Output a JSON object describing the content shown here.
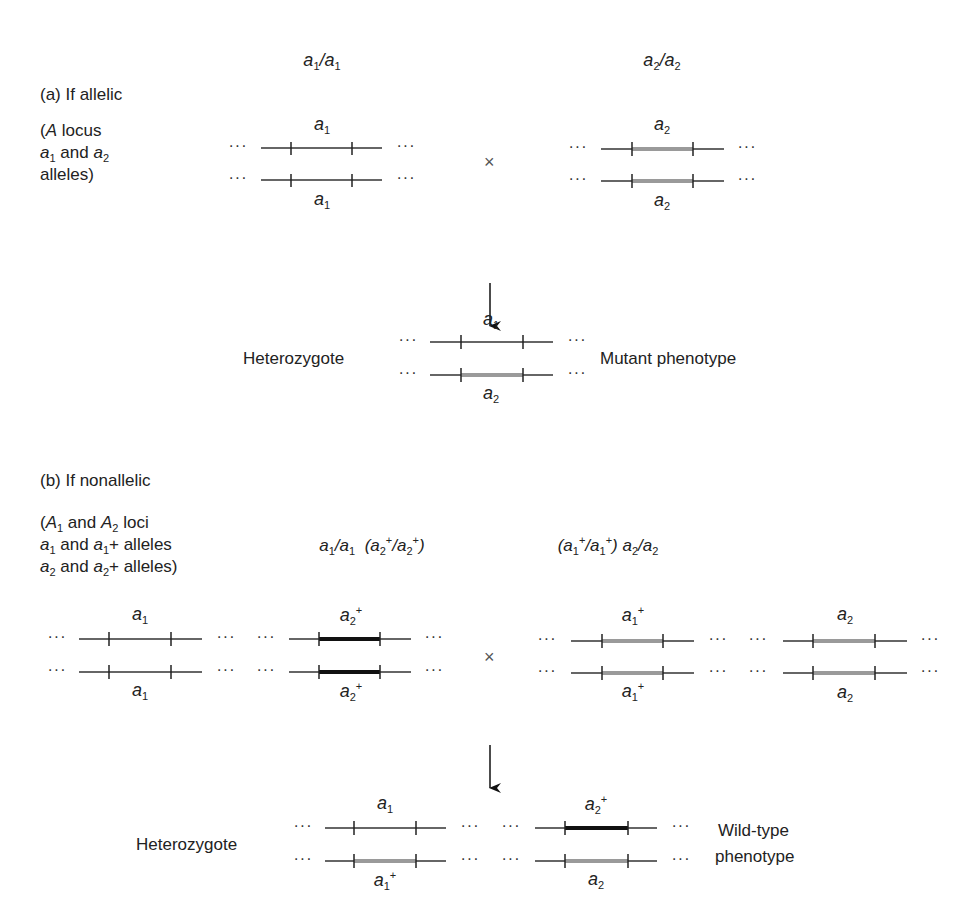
{
  "part_a": {
    "title": "(a) If allelic",
    "legend": [
      "(A locus",
      "a1 and a2",
      "alleles)"
    ],
    "parent1": {
      "genotype": "a1/a1",
      "top_allele": "a1",
      "bottom_allele": "a1"
    },
    "parent2": {
      "genotype": "a2/a2",
      "top_allele": "a2",
      "bottom_allele": "a2"
    },
    "cross_symbol": "×",
    "offspring": {
      "label": "Heterozygote",
      "top_allele": "a1",
      "bottom_allele": "a2",
      "phenotype": "Mutant phenotype"
    }
  },
  "part_b": {
    "title": "(b) If nonallelic",
    "legend": [
      "(A1 and A2 loci",
      "a1 and a1+ alleles",
      "a2 and a2+ alleles)"
    ],
    "parent1": {
      "genotype": "a1/a1 (a2+/a2+)",
      "locus1": {
        "top": "a1",
        "bottom": "a1"
      },
      "locus2": {
        "top": "a2+",
        "bottom": "a2+"
      }
    },
    "parent2": {
      "genotype": "(a1+/a1+) a2/a2",
      "locus1": {
        "top": "a1+",
        "bottom": "a1+"
      },
      "locus2": {
        "top": "a2",
        "bottom": "a2"
      }
    },
    "cross_symbol": "×",
    "offspring": {
      "label": "Heterozygote",
      "locus1": {
        "top": "a1",
        "bottom": "a1+"
      },
      "locus2": {
        "top": "a2+",
        "bottom": "a2"
      },
      "phenotype_line1": "Wild-type",
      "phenotype_line2": "phenotype"
    }
  },
  "ellipsis": "···",
  "colors": {
    "line": "#333333",
    "mutant_gray": "#9a9a9a",
    "wildtype_black": "#111111"
  }
}
